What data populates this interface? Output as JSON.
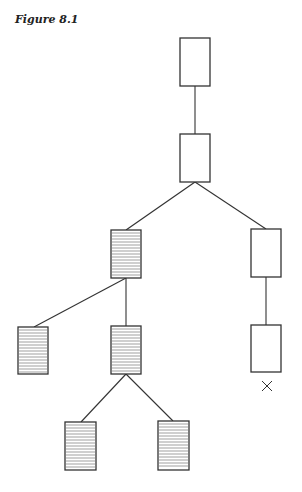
{
  "figure": {
    "title": "Figure 8.1",
    "stroke_color": "#333333",
    "hatch_color": "#777777"
  },
  "tree": {
    "nodes": [
      {
        "id": "root",
        "x": 180,
        "y": 38,
        "w": 30,
        "h": 48,
        "hatched": false
      },
      {
        "id": "n2",
        "x": 180,
        "y": 134,
        "w": 30,
        "h": 48,
        "hatched": false
      },
      {
        "id": "n3-left",
        "x": 111,
        "y": 230,
        "w": 30,
        "h": 48,
        "hatched": true
      },
      {
        "id": "n3-right",
        "x": 251,
        "y": 229,
        "w": 30,
        "h": 48,
        "hatched": false
      },
      {
        "id": "n4-leftleft",
        "x": 18,
        "y": 327,
        "w": 30,
        "h": 47,
        "hatched": true
      },
      {
        "id": "n4-mid",
        "x": 111,
        "y": 326,
        "w": 30,
        "h": 48,
        "hatched": true
      },
      {
        "id": "n4-right",
        "x": 251,
        "y": 325,
        "w": 30,
        "h": 47,
        "hatched": false
      },
      {
        "id": "n5-left",
        "x": 65,
        "y": 422,
        "w": 31,
        "h": 48,
        "hatched": true
      },
      {
        "id": "n5-right",
        "x": 158,
        "y": 421,
        "w": 31,
        "h": 49,
        "hatched": true
      }
    ],
    "edges": [
      {
        "x1": 195,
        "y1": 86,
        "x2": 195,
        "y2": 134
      },
      {
        "x1": 195,
        "y1": 182,
        "x2": 126,
        "y2": 230
      },
      {
        "x1": 195,
        "y1": 182,
        "x2": 266,
        "y2": 229
      },
      {
        "x1": 126,
        "y1": 278,
        "x2": 34,
        "y2": 327
      },
      {
        "x1": 126,
        "y1": 278,
        "x2": 126,
        "y2": 326
      },
      {
        "x1": 266,
        "y1": 277,
        "x2": 266,
        "y2": 325
      },
      {
        "x1": 126,
        "y1": 374,
        "x2": 81,
        "y2": 422
      },
      {
        "x1": 126,
        "y1": 374,
        "x2": 173,
        "y2": 421
      }
    ],
    "markers": [
      {
        "type": "cross",
        "symbol": "×",
        "x": 267,
        "y": 386
      }
    ]
  }
}
